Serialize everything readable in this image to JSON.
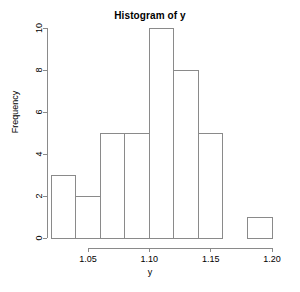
{
  "chart_data": {
    "type": "bar",
    "title": "Histogram of y",
    "xlabel": "y",
    "ylabel": "Frequency",
    "bin_width": 0.01,
    "bin_edges": [
      1.02,
      1.03,
      1.04,
      1.05,
      1.06,
      1.07,
      1.08,
      1.09,
      1.1,
      1.11,
      1.12,
      1.13,
      1.14,
      1.15,
      1.16,
      1.17,
      1.18,
      1.19
    ],
    "categories": [
      "1.02-1.03",
      "1.03-1.04",
      "1.04-1.05",
      "1.05-1.06",
      "1.06-1.07",
      "1.07-1.08",
      "1.08-1.09",
      "1.09-1.10",
      "1.10-1.11",
      "1.11-1.12",
      "1.12-1.13",
      "1.13-1.14",
      "1.14-1.15",
      "1.15-1.16",
      "1.16-1.17",
      "1.17-1.18",
      "1.18-1.19"
    ],
    "values": [
      3,
      3,
      2,
      2,
      5,
      5,
      5,
      5,
      10,
      10,
      8,
      8,
      5,
      5,
      0,
      0,
      1
    ],
    "bars": [
      {
        "x0": 1.02,
        "x1": 1.04,
        "value": 3
      },
      {
        "x0": 1.04,
        "x1": 1.06,
        "value": 2
      },
      {
        "x0": 1.06,
        "x1": 1.08,
        "value": 5
      },
      {
        "x0": 1.08,
        "x1": 1.1,
        "value": 5
      },
      {
        "x0": 1.1,
        "x1": 1.12,
        "value": 10
      },
      {
        "x0": 1.12,
        "x1": 1.14,
        "value": 8
      },
      {
        "x0": 1.14,
        "x1": 1.16,
        "value": 5
      },
      {
        "x0": 1.18,
        "x1": 1.2,
        "value": 1
      }
    ],
    "xlim": [
      1.02,
      1.2
    ],
    "ylim": [
      0,
      10
    ],
    "xticks": [
      1.05,
      1.1,
      1.15,
      1.2
    ],
    "xtick_labels": [
      "1.05",
      "1.10",
      "1.15",
      "1.20"
    ],
    "yticks": [
      0,
      2,
      4,
      6,
      8,
      10
    ],
    "ytick_labels": [
      "0",
      "2",
      "4",
      "6",
      "8",
      "10"
    ],
    "grid": false,
    "legend": null,
    "bar_fill_color": "#ffffff",
    "bar_border_color": "#8a8a8a",
    "axis_color": "#8a8a8a",
    "text_color": "#000000",
    "background_color": "#ffffff"
  },
  "plot_geometry": {
    "x_axis_pixel_start": 88,
    "x_axis_pixel_end": 272,
    "x_value_start": 1.05,
    "x_value_end": 1.2,
    "y_axis_pixel_bottom": 238,
    "y_axis_pixel_top": 28,
    "y_value_bottom": 0,
    "y_value_top": 10
  }
}
